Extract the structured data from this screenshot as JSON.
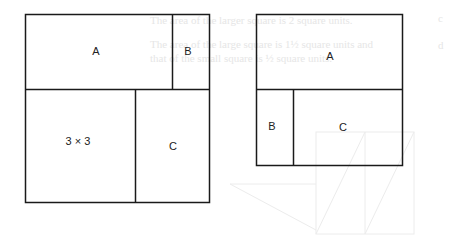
{
  "background_text": {
    "markers": [
      "c",
      "d"
    ],
    "line1": "The area of the larger square is 2 square units.",
    "line2": "The area of the large square is 1½ square units and",
    "line3": "that of the small square is ½ square units."
  },
  "left_diagram": {
    "region_a": "A",
    "region_b": "B",
    "region_square": "3 × 3",
    "region_c": "C"
  },
  "right_diagram": {
    "region_a": "A",
    "region_b": "B",
    "region_c": "C"
  },
  "colors": {
    "line": "#1a1a1a",
    "background": "#ffffff",
    "bleed": "#e6e6e6"
  }
}
